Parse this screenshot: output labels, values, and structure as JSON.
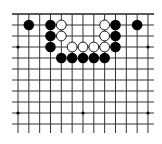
{
  "board": {
    "title": "Go board diagram (partial, top edge)",
    "colors": {
      "background": "#ffffff",
      "lines": "#333333",
      "black": "#000000",
      "white": "#ffffff"
    },
    "geometry": {
      "origin_x": 18,
      "origin_y": 14,
      "spacing_x": 10.83,
      "spacing_y": 11,
      "cols": 13,
      "rows": 11,
      "line_left_stub": 12,
      "line_right_stub": 154,
      "line_bottom": 133
    },
    "hoshi": [
      {
        "col": 0,
        "row": 3
      },
      {
        "col": 6,
        "row": 3
      },
      {
        "col": 12,
        "row": 3
      },
      {
        "col": 0,
        "row": 9
      },
      {
        "col": 6,
        "row": 9
      },
      {
        "col": 12,
        "row": 9
      }
    ],
    "stones": [
      {
        "color": "black",
        "col": 1,
        "row": 1
      },
      {
        "color": "black",
        "col": 3,
        "row": 1
      },
      {
        "color": "white",
        "col": 4,
        "row": 1
      },
      {
        "color": "white",
        "col": 8,
        "row": 1
      },
      {
        "color": "black",
        "col": 9,
        "row": 1
      },
      {
        "color": "black",
        "col": 11,
        "row": 1
      },
      {
        "color": "black",
        "col": 3,
        "row": 2
      },
      {
        "color": "white",
        "col": 4,
        "row": 2
      },
      {
        "color": "white",
        "col": 8,
        "row": 2
      },
      {
        "color": "black",
        "col": 9,
        "row": 2
      },
      {
        "color": "black",
        "col": 3,
        "row": 3
      },
      {
        "color": "white",
        "col": 5,
        "row": 3
      },
      {
        "color": "white",
        "col": 6,
        "row": 3
      },
      {
        "color": "white",
        "col": 7,
        "row": 3
      },
      {
        "color": "white",
        "col": 8,
        "row": 3
      },
      {
        "color": "black",
        "col": 9,
        "row": 3
      },
      {
        "color": "black",
        "col": 4,
        "row": 4
      },
      {
        "color": "black",
        "col": 5,
        "row": 4
      },
      {
        "color": "black",
        "col": 6,
        "row": 4
      },
      {
        "color": "black",
        "col": 7,
        "row": 4
      },
      {
        "color": "black",
        "col": 8,
        "row": 4
      }
    ]
  }
}
